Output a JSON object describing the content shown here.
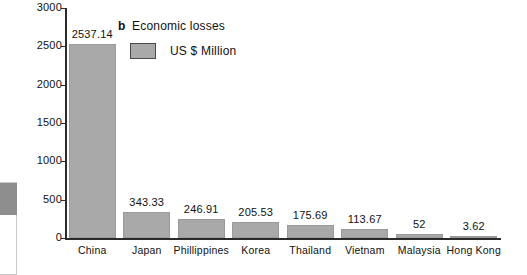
{
  "chart_data": {
    "type": "bar",
    "title": "Economic losses",
    "panel_label": "b",
    "unit_label": "US $ Million",
    "xlabel": "",
    "ylabel": "",
    "ylim": [
      0,
      3000
    ],
    "yticks": [
      3000,
      2500,
      2000,
      1500,
      1000,
      500,
      0
    ],
    "grid": false,
    "legend_position": "top-center",
    "bar_color": "#a9a9a9",
    "axis_color": "#2b2b2b",
    "categories": [
      "China",
      "Japan",
      "Phillippines",
      "Korea",
      "Thailand",
      "Vietnam",
      "Malaysia",
      "Hong Kong"
    ],
    "values": [
      2537.14,
      343.33,
      246.91,
      205.53,
      175.69,
      113.67,
      52,
      3.62
    ],
    "value_labels": [
      "2537.14",
      "343.33",
      "246.91",
      "205.53",
      "175.69",
      "113.67",
      "52",
      "3.62"
    ]
  },
  "artifact": {
    "name": "scan-edge-artifact"
  }
}
